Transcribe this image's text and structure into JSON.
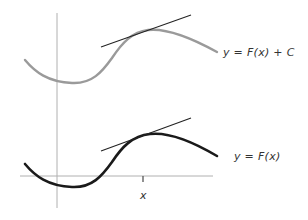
{
  "diagram": {
    "curves": [
      {
        "id": "shifted",
        "label": "y = F(x) + C",
        "color": "#9a9a9a"
      },
      {
        "id": "base",
        "label": "y = F(x)",
        "color": "#1a1a1a"
      }
    ],
    "axis": {
      "x_label": "x",
      "axis_color": "#b0b0b0"
    },
    "tangent": {
      "color": "#222222",
      "description": "Tangent lines at the same x have equal slope"
    }
  }
}
